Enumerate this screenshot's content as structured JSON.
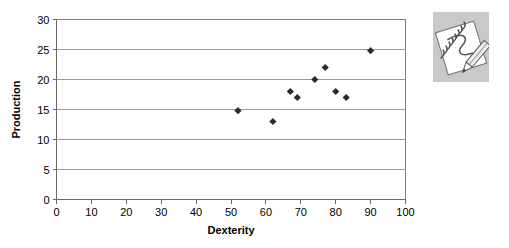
{
  "chart_data": {
    "type": "scatter",
    "title": "",
    "xlabel": "Dexterity",
    "ylabel": "Production",
    "xlim": [
      0,
      100
    ],
    "ylim": [
      0,
      30
    ],
    "xticks": [
      0,
      10,
      20,
      30,
      40,
      50,
      60,
      70,
      80,
      90,
      100
    ],
    "yticks": [
      0,
      5,
      10,
      15,
      20,
      25,
      30
    ],
    "grid": "horizontal",
    "legend": "none",
    "marker": "diamond",
    "marker_color": "#2b2b2b",
    "series": [
      {
        "name": "Production vs Dexterity",
        "points": [
          {
            "x": 52,
            "y": 14.8
          },
          {
            "x": 62,
            "y": 13.0
          },
          {
            "x": 67,
            "y": 18.0
          },
          {
            "x": 69,
            "y": 17.0
          },
          {
            "x": 74,
            "y": 20.0
          },
          {
            "x": 77,
            "y": 22.0
          },
          {
            "x": 80,
            "y": 18.0
          },
          {
            "x": 83,
            "y": 17.0
          },
          {
            "x": 90,
            "y": 24.8
          }
        ]
      }
    ]
  },
  "clipart": {
    "name": "notepad-with-pencil",
    "background_color": "#c9c9c9",
    "paper_color": "#ffffff",
    "ink_color": "#555555"
  }
}
